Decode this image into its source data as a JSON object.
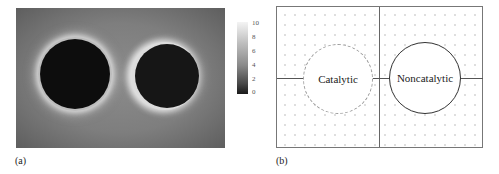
{
  "panels": {
    "a": {
      "label": "(a)",
      "colorbar": {
        "ticks": [
          "10",
          "8",
          "6",
          "4",
          "2",
          "0"
        ],
        "min": 0,
        "max": 10
      }
    },
    "b": {
      "label": "(b)",
      "circles": [
        {
          "name": "catalytic",
          "label": "Catalytic",
          "border": "dashed"
        },
        {
          "name": "noncatalytic",
          "label": "Noncatalytic",
          "border": "solid"
        }
      ]
    }
  }
}
